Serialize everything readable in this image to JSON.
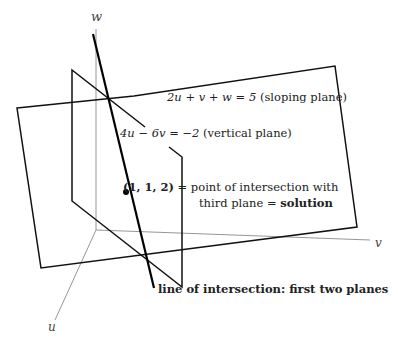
{
  "axes": {
    "w_label": "w",
    "v_label": "v",
    "u_label": "u"
  },
  "planes": {
    "sloping": {
      "equation": "2u + v + w = 5",
      "description": "(sloping plane)"
    },
    "vertical": {
      "equation": "4u − 6v = −2",
      "description": "(vertical plane)"
    }
  },
  "solution_point": {
    "coords": "(1, 1, 2)",
    "equals": "=",
    "text_line1": "point of intersection with",
    "text_line2_prefix": "third plane =",
    "text_line2_bold": "solution"
  },
  "intersection_line": {
    "label": "line of intersection: first two planes"
  },
  "colors": {
    "plane_edge": "#111111",
    "axis": "#888888",
    "line": "#000000"
  }
}
